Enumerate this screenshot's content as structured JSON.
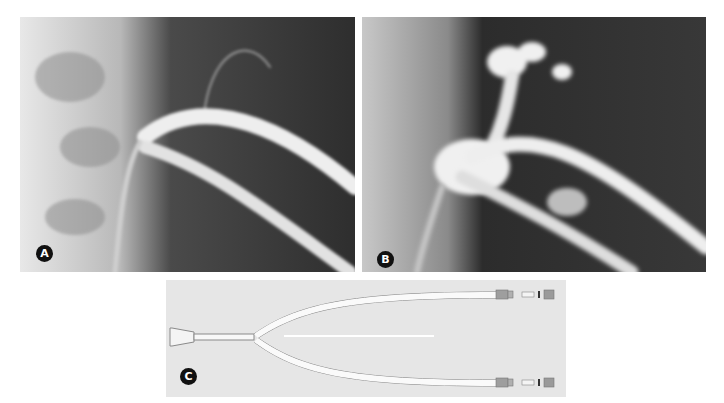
{
  "figure": {
    "panels": [
      {
        "id": "A",
        "label": "A",
        "description": "Radiograph with Y-catheter in vessel, two contrast-filled limbs"
      },
      {
        "id": "B",
        "label": "B",
        "description": "Radiograph showing contrast extravasation and branching vessels"
      },
      {
        "id": "C",
        "label": "C",
        "description": "Bifurcated Y-shaped catheter with hub and two connectors"
      }
    ]
  },
  "colors": {
    "xray_dark": "#333333",
    "xray_bright": "#f2f2f2",
    "label_bg": "#111111",
    "device_bg": "#e6e6e6"
  }
}
